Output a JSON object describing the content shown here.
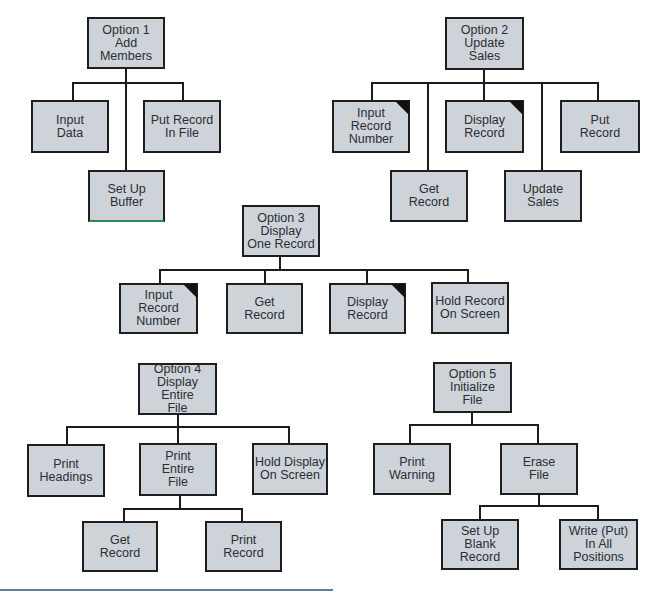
{
  "diagram": {
    "type": "hierarchy-chart",
    "options": [
      {
        "id": "option1",
        "title": "Option 1\nAdd Members",
        "children": [
          "Input\nData",
          "Set Up\nBuffer",
          "Put Record\nIn File"
        ]
      },
      {
        "id": "option2",
        "title": "Option 2\nUpdate Sales",
        "children": [
          "Input\nRecord\nNumber",
          "Get\nRecord",
          "Display\nRecord",
          "Update\nSales",
          "Put\nRecord"
        ]
      },
      {
        "id": "option3",
        "title": "Option 3\nDisplay\nOne Record",
        "children": [
          "Input\nRecord\nNumber",
          "Get\nRecord",
          "Display\nRecord",
          "Hold Record\nOn Screen"
        ]
      },
      {
        "id": "option4",
        "title": "Option 4\nDisplay\nEntire\nFile",
        "children": [
          "Print\nHeadings",
          "Print\nEntire\nFile",
          "Hold Display\nOn Screen"
        ],
        "grandchildren": [
          "Get\nRecord",
          "Print\nRecord"
        ]
      },
      {
        "id": "option5",
        "title": "Option 5\nInitialize\nFile",
        "children": [
          "Print\nWarning",
          "Erase\nFile"
        ],
        "grandchildren": [
          "Set Up\nBlank Record",
          "Write (Put)\nIn All\nPositions"
        ]
      }
    ],
    "colors": {
      "box_fill": "#cdd3d8",
      "box_border": "#1e1e1e",
      "connector": "#1c1c1c",
      "rule": "#5f7f98",
      "corner_marker": "#111111"
    }
  }
}
